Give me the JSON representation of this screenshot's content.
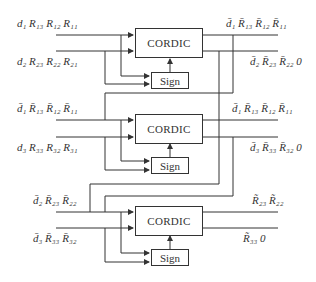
{
  "blocks": [
    {
      "cordic_label": "CORDIC",
      "sign_label": "Sign",
      "inputs": [
        "d₁ R₁₃ R₁₂ R₁₁",
        "d₂ R₂₃ R₂₂ R₂₁"
      ],
      "outputs": [
        "d̄₁ R̄₁₃ R̄₁₂ R̄₁₁",
        "d̄₂ R̄₂₃ R̄₂₂ 0"
      ]
    },
    {
      "cordic_label": "CORDIC",
      "sign_label": "Sign",
      "inputs": [
        "d̄₁ R̄₁₃ R̄₁₂ R̄₁₁",
        "d₃ R₃₃ R₃₂ R₃₁"
      ],
      "outputs": [
        "d̄₁ R̄₁₃ R̄₁₂ R̄₁₁",
        "d̄₃ R̄₃₃ R̄₃₂ 0"
      ]
    },
    {
      "cordic_label": "CORDIC",
      "sign_label": "Sign",
      "inputs": [
        "d̄₂ R̄₂₃ R̄₂₂",
        "d̄₃ R̄₃₃ R̄₃₂"
      ],
      "outputs": [
        "R̃₂₃ R̃₂₂",
        "R̃₃₃ 0"
      ]
    }
  ]
}
